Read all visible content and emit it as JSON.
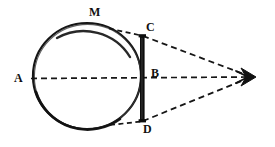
{
  "figure": {
    "background_color": "#ffffff",
    "ink_color": "#111111",
    "width": 275,
    "height": 147,
    "labels": [
      {
        "id": "A",
        "text": "A",
        "x": 22,
        "y": 79,
        "description": "left extremity of the sphere on the axis"
      },
      {
        "id": "M",
        "text": "M",
        "x": 95,
        "y": 13,
        "description": "point on the upper arc of the sphere"
      },
      {
        "id": "C",
        "text": "C",
        "x": 150,
        "y": 28,
        "description": "upper end of the illuminated chord"
      },
      {
        "id": "B",
        "text": "B",
        "x": 155,
        "y": 73,
        "description": "midpoint of the chord on the axis"
      },
      {
        "id": "D",
        "text": "D",
        "x": 147,
        "y": 130,
        "description": "lower end of the illuminated chord"
      }
    ],
    "circle": {
      "center_x": 87,
      "center_y": 76,
      "radius_x": 54,
      "radius_y": 53,
      "stroke_color": "#111111",
      "fill": "none"
    },
    "chord": {
      "label": "CD",
      "x": 142,
      "y_top": 35,
      "y_bottom": 122,
      "thickness": 5,
      "fill_color": "#111111",
      "description": "thick black vertical bar from C to D"
    },
    "eye": {
      "label": "eye",
      "x": 248,
      "y": 77,
      "description": "stylized eye / observer at the apex of the cone"
    },
    "rays": [
      {
        "id": "axis-ray",
        "from": "A",
        "to": "eye",
        "style": "dashed",
        "x1": 34,
        "y1": 78,
        "x2": 246,
        "y2": 77
      },
      {
        "id": "upper-ray",
        "from": "C",
        "to": "eye",
        "style": "dashed",
        "x1": 143,
        "y1": 36,
        "x2": 246,
        "y2": 75
      },
      {
        "id": "lower-ray",
        "from": "D",
        "to": "eye",
        "style": "dashed",
        "x1": 143,
        "y1": 121,
        "x2": 246,
        "y2": 79
      },
      {
        "id": "tangent-upper",
        "from": "M-arc",
        "to": "C",
        "style": "dashed",
        "x1": 111,
        "y1": 29,
        "x2": 142,
        "y2": 36
      },
      {
        "id": "tangent-lower",
        "from": "arc",
        "to": "D",
        "style": "dashed",
        "x1": 112,
        "y1": 124,
        "x2": 142,
        "y2": 121
      }
    ]
  }
}
